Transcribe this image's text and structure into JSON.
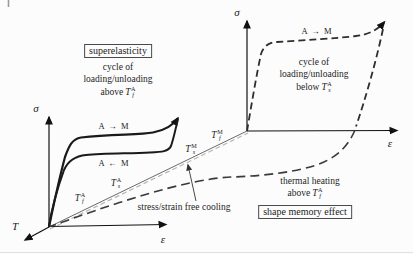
{
  "figure": {
    "left_panel": {
      "title_box": "superelasticity",
      "cycle_line1": "cycle of",
      "cycle_line2": "loading/unloading",
      "condition_prefix": "above",
      "condition_temp": {
        "base": "T",
        "sup": "A",
        "sub": "f"
      },
      "upper_plateau_label": "A → M",
      "lower_plateau_label": "A ← M",
      "sigma_axis_label": "σ",
      "epsilon_axis_label": "ε",
      "temp_axis_label": "T"
    },
    "right_panel": {
      "plateau_label": "A → M",
      "cycle_line1": "cycle of",
      "cycle_line2": "loading/unloading",
      "condition_prefix": "below",
      "condition_temp": {
        "base": "T",
        "sup": "A",
        "sub": "s"
      },
      "sigma_axis_label": "σ",
      "epsilon_axis_label": "ε",
      "heating_line1": "thermal heating",
      "heating_prefix": "above",
      "heating_temp": {
        "base": "T",
        "sup": "A",
        "sub": "f"
      },
      "title_box": "shape memory effect"
    },
    "temperature_axis": {
      "cooling_label": "stress/strain free cooling",
      "markers": [
        {
          "base": "T",
          "sup": "A",
          "sub": "f"
        },
        {
          "base": "T",
          "sup": "A",
          "sub": "s"
        },
        {
          "base": "T",
          "sup": "M",
          "sub": "s"
        },
        {
          "base": "T",
          "sup": "M",
          "sub": "f"
        }
      ]
    },
    "colors": {
      "solid_curve": "#1a1a1a",
      "dashed_curve": "#2e2e2e",
      "heating_curve": "#3a3a3a",
      "axis": "#111111",
      "temp_line": "#6a6a6a",
      "cooling_dash": "#b5b5b5"
    }
  }
}
